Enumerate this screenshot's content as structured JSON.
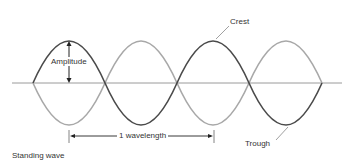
{
  "diagram": {
    "title": "Standing wave",
    "labels": {
      "amplitude": "Amplitude",
      "crest": "Crest",
      "trough": "Trough",
      "wavelength": "1 wavelength"
    },
    "colors": {
      "wave_dark": "#4a4a4a",
      "wave_light": "#a8a8a8",
      "axis": "#9a9a9a",
      "text": "#333333"
    }
  }
}
